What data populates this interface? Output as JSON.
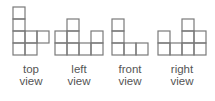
{
  "views": [
    {
      "id": "top",
      "label_line1": "top",
      "label_line2": "view",
      "grid": [
        [
          1,
          0,
          0
        ],
        [
          1,
          0,
          0
        ],
        [
          1,
          1,
          1
        ],
        [
          1,
          1,
          0
        ]
      ]
    },
    {
      "id": "left",
      "label_line1": "left",
      "label_line2": "view",
      "grid": [
        [
          0,
          1,
          0,
          0
        ],
        [
          1,
          1,
          0,
          1
        ],
        [
          1,
          1,
          1,
          1
        ]
      ]
    },
    {
      "id": "front",
      "label_line1": "front",
      "label_line2": "view",
      "grid": [
        [
          1,
          0,
          0
        ],
        [
          1,
          0,
          0
        ],
        [
          1,
          1,
          1
        ]
      ]
    },
    {
      "id": "right",
      "label_line1": "right",
      "label_line2": "view",
      "grid": [
        [
          0,
          0,
          1,
          0
        ],
        [
          1,
          0,
          1,
          1
        ],
        [
          1,
          1,
          1,
          1
        ]
      ]
    }
  ],
  "colors": {
    "grid_stroke": "#7a7a7a",
    "label_text": "#555555"
  }
}
